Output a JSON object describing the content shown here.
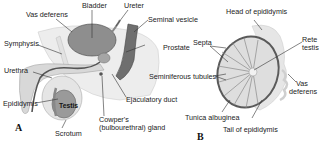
{
  "figure_a": {
    "panel_label": "A",
    "labels": {
      "vas_deferens": "Vas deferens",
      "bladder": "Bladder",
      "ureter": "Ureter",
      "seminal_vesicle": "Seminal vesicle",
      "symphysis": "Symphysis",
      "prostate": "Prostate",
      "urethra": "Urethra",
      "epididymis": "Epididymis",
      "testis": "Testis",
      "ejaculatory_duct": "Ejaculatory duct",
      "cowpers_line1": "Cowper's",
      "cowpers_line2": "(bulbourethral) gland",
      "scrotum": "Scrotum"
    }
  },
  "figure_b": {
    "panel_label": "B",
    "labels": {
      "head_of_epididymis": "Head of epididymis",
      "septa": "Septa",
      "rete_line1": "Rete",
      "rete_line2": "testis",
      "seminiferous_tubules": "Seminiferous tubules",
      "vas_line1": "Vas",
      "vas_line2": "deferens",
      "tunica_albuginea": "Tunica albuginea",
      "tail_of_epididymis": "Tail of epididymis"
    }
  }
}
